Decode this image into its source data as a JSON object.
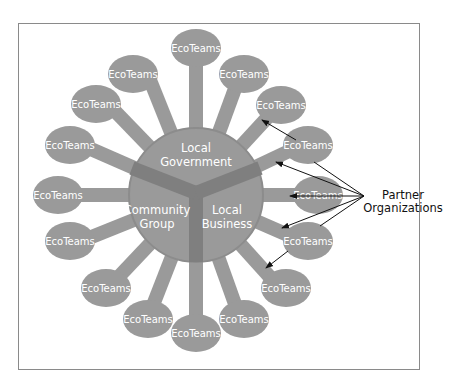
{
  "diagram": {
    "hub": {
      "sectors": [
        {
          "label_line1": "Local",
          "label_line2": "Government"
        },
        {
          "label_line1": "Community",
          "label_line2": "Group"
        },
        {
          "label_line1": "Local",
          "label_line2": "Business"
        }
      ]
    },
    "nodes": [
      "EcoTeams",
      "EcoTeams",
      "EcoTeams",
      "EcoTeams",
      "EcoTeams",
      "EcoTeams",
      "EcoTeams",
      "EcoTeams",
      "EcoTeams",
      "EcoTeams",
      "EcoTeams",
      "EcoTeams",
      "EcoTeams",
      "EcoTeams",
      "EcoTeams",
      "EcoTeams"
    ],
    "callout": {
      "line1": "Partner",
      "line2": "Organizations"
    },
    "colors": {
      "fill": "#9a9a9a",
      "divider": "#7f7f7f",
      "hub_outline": "#8c8c8c",
      "text": "#ffffff",
      "arrow": "#111111"
    }
  }
}
